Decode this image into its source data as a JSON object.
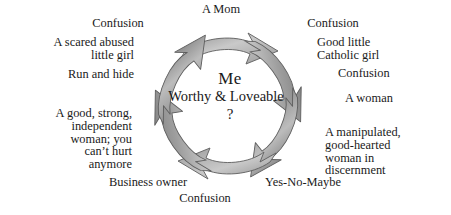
{
  "diagram": {
    "title_center": {
      "line1": "Me",
      "line2": "Worthy & Loveable",
      "line3": "?"
    },
    "ring": {
      "icon": "circular-arrows-icon",
      "direction": "clockwise",
      "arrow_count": 6,
      "arrow_fill_light": "#d6d6d6",
      "arrow_fill_mid": "#a8a8a8",
      "arrow_fill_dark": "#6e6e6e",
      "arrow_outline": "#5a5a5a"
    },
    "labels": [
      {
        "name": "label-a-mom",
        "text": "A Mom"
      },
      {
        "name": "label-confusion-top-left",
        "text": "Confusion"
      },
      {
        "name": "label-confusion-top-right",
        "text": "Confusion"
      },
      {
        "name": "label-scared-abused-girl",
        "text": "A scared abused\nlittle girl"
      },
      {
        "name": "label-good-little-catholic-girl",
        "text": "Good little\nCatholic girl"
      },
      {
        "name": "label-run-and-hide",
        "text": "Run and hide"
      },
      {
        "name": "label-confusion-right",
        "text": "Confusion"
      },
      {
        "name": "label-a-woman",
        "text": "A woman"
      },
      {
        "name": "label-good-strong-independent",
        "text": "A good, strong,\nindependent\nwoman; you\ncan’t hurt\nanymore"
      },
      {
        "name": "label-manipulated-good-hearted",
        "text": "A manipulated,\ngood-hearted\nwoman in\ndiscernment"
      },
      {
        "name": "label-business-owner",
        "text": "Business owner"
      },
      {
        "name": "label-yes-no-maybe",
        "text": "Yes-No-Maybe"
      },
      {
        "name": "label-confusion-bottom",
        "text": "Confusion"
      }
    ]
  }
}
